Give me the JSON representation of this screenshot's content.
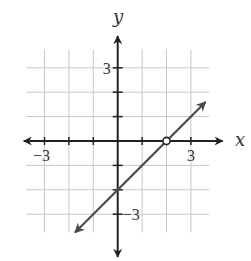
{
  "chart_data": {
    "type": "line",
    "title": "",
    "xlabel": "x",
    "ylabel": "y",
    "xlim": [
      -4,
      4
    ],
    "ylim": [
      -4,
      4
    ],
    "grid": true,
    "grid_range": {
      "x": [
        -3.75,
        3.75
      ],
      "y": [
        -3.75,
        3.75
      ]
    },
    "tick_labels": {
      "x": [
        {
          "value": -3,
          "label": "−3"
        },
        {
          "value": 3,
          "label": "3"
        }
      ],
      "y": [
        {
          "value": 3,
          "label": "3"
        },
        {
          "value": -3,
          "label": "−3"
        }
      ]
    },
    "series": [
      {
        "name": "y = x - 2",
        "slope": 1,
        "intercept": -2,
        "x": [
          -1.75,
          3.6
        ],
        "y": [
          -3.75,
          1.6
        ],
        "arrows": "both",
        "color": "#4a4a4a"
      }
    ],
    "annotations": [
      {
        "type": "open-circle",
        "x": 2,
        "y": 0
      }
    ]
  },
  "colors": {
    "axis": "#222222",
    "grid": "#c8c8c8",
    "line": "#4a4a4a"
  }
}
